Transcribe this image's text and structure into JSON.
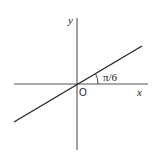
{
  "diagram": {
    "x_axis_label": "x",
    "y_axis_label": "y",
    "origin_label": "O",
    "angle_label": "π/6",
    "colors": {
      "axis": "#444444",
      "line": "#222222",
      "background": "#ffffff"
    }
  }
}
